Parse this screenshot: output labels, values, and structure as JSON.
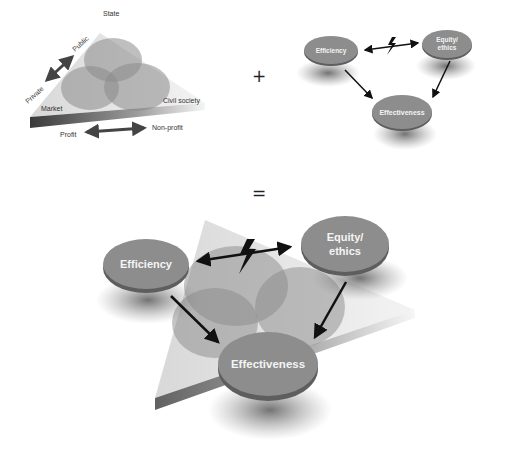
{
  "operators": {
    "plus": "+",
    "equals": "="
  },
  "left_diagram": {
    "circles": {
      "top": "State",
      "left": "Market",
      "right": "Civil society"
    },
    "axis_vertical": {
      "end_a": "Private",
      "end_b": "Public"
    },
    "axis_horizontal": {
      "end_a": "Profit",
      "end_b": "Non-profit"
    }
  },
  "right_diagram": {
    "nodes": {
      "efficiency": "Efficiency",
      "equity_line1": "Equity/",
      "equity_line2": "ethics",
      "effectiveness": "Effectiveness"
    },
    "tension_icon": "lightning-bolt"
  },
  "combined_diagram": {
    "nodes": {
      "efficiency": "Efficiency",
      "equity_line1": "Equity/",
      "equity_line2": "ethics",
      "effectiveness": "Effectiveness"
    },
    "tension_icon": "lightning-bolt"
  },
  "colors": {
    "disc": "#8d8d8d",
    "disc_edge": "#5e5e5e",
    "circle": "#9a9a9a",
    "triangle": "#e4e4e4",
    "arrow": "#111111"
  }
}
